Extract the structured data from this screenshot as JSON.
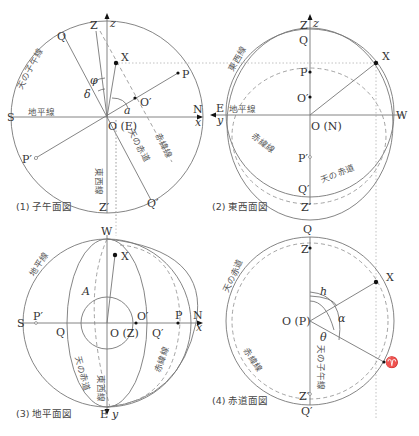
{
  "panels": [
    {
      "caption": "(1) 子午面図",
      "labels": {
        "Z": "Z",
        "z": "z",
        "Q": "Q",
        "X": "X",
        "P": "P",
        "phi": "φ",
        "delta": "δ",
        "O_prime": "O′",
        "a": "a",
        "S": "S",
        "N": "N",
        "x": "x",
        "O": "O (E)",
        "P_prime": "P′",
        "Q_prime": "Q′",
        "Z_prime": "Z′",
        "meridian": "天の子午線",
        "horizon": "地平線",
        "equator": "天の赤道",
        "declination_line": "赤緯線",
        "east_west_line": "東西線"
      }
    },
    {
      "caption": "(2) 東西面図",
      "labels": {
        "Z": "Z",
        "z": "z",
        "Q": "Q",
        "X": "X",
        "P": "P",
        "O_prime": "O′",
        "E": "E",
        "y": "y",
        "W": "W",
        "O": "O (N)",
        "P_prime": "P′",
        "Q_prime": "Q′",
        "Z_prime": "Z′",
        "east_west_line": "東西線",
        "horizon": "地平線",
        "declination_line": "赤緯線",
        "equator": "天の赤道"
      }
    },
    {
      "caption": "(3) 地平面図",
      "labels": {
        "W": "W",
        "X": "X",
        "A": "A",
        "S": "S",
        "P_prime": "P′",
        "Q": "Q",
        "O": "O (Z)",
        "O_prime": "O′",
        "Q_prime": "Q′",
        "P": "P",
        "N": "N",
        "x": "x",
        "E": "E",
        "y": "y",
        "horizon": "地平線",
        "equator": "天の赤道",
        "east_west_line": "東西線",
        "declination_line": "赤緯線"
      }
    },
    {
      "caption": "(4) 赤道面図",
      "labels": {
        "Q": "Q",
        "Z": "Z",
        "X": "X",
        "h": "h",
        "alpha": "α",
        "O": "O (P)",
        "theta": "θ",
        "aries": "♈",
        "Z_prime": "Z′",
        "Q_prime": "Q′",
        "equator": "天の赤道",
        "declination_line": "赤緯線",
        "meridian": "天の子午線"
      }
    }
  ]
}
